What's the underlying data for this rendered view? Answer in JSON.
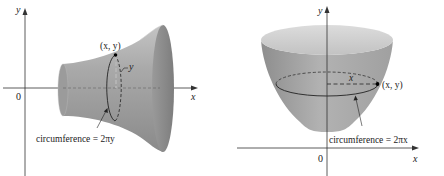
{
  "figures": [
    {
      "id": "left",
      "description": "Surface of revolution about the x-axis (funnel/horn shape)",
      "axes": {
        "x_label": "x",
        "y_label": "y",
        "origin_label": "0"
      },
      "point_label": "(x, y)",
      "radius_label": "y",
      "annotation": "circumference = 2πy"
    },
    {
      "id": "right",
      "description": "Surface of revolution about the y-axis (bowl/paraboloid shape)",
      "axes": {
        "x_label": "x",
        "y_label": "y",
        "origin_label": "0"
      },
      "point_label": "(x, y)",
      "radius_label": "x",
      "annotation": "circumference = 2πx"
    }
  ],
  "colors": {
    "surface_dark": "#8c8c8c",
    "surface_mid": "#a8a8a8",
    "surface_light": "#cfcfcf",
    "axis": "#333333",
    "text": "#222222"
  }
}
